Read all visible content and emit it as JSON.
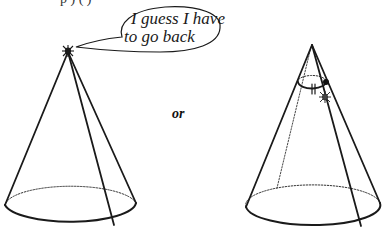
{
  "figure": {
    "top_fragment": "p     ) (       )",
    "speech_bubble": {
      "line1": "I guess I have",
      "line2": "to go back"
    },
    "connector_label": "or",
    "left_cone": {
      "description": "cone with bug at apex",
      "apex": [
        68,
        52
      ],
      "base_center": [
        70,
        208
      ],
      "base_rx": 66,
      "base_ry": 20
    },
    "right_cone": {
      "description": "cone with bug on side, cross-section loop with tick marks",
      "apex": [
        312,
        45
      ],
      "base_center": [
        313,
        205
      ],
      "base_rx": 67,
      "base_ry": 20,
      "marker": "||"
    },
    "colors": {
      "line": "#1a1a1a",
      "background": "#ffffff"
    }
  }
}
